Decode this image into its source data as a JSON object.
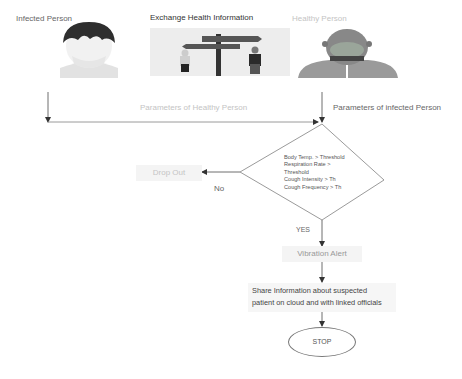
{
  "top_labels": {
    "infected": "Infected Person",
    "exchange": "Exchange Health Information",
    "healthy": "Healthy Person"
  },
  "images": {
    "infected": "infected-person-avatar",
    "exchange": "signpost-exchange-illustration",
    "healthy": "healthy-person-avatar"
  },
  "flow": {
    "param_healthy": "Parameters of Healthy Person",
    "param_infected": "Parameters of infected Person",
    "decision_lines": [
      "Body Temp. > Threshold",
      "Respiration Rate >",
      "Threshold",
      "Cough Intensity > Th",
      "Cough Frequency > Th"
    ],
    "no_label": "No",
    "yes_label": "YES",
    "drop_out": "Drop Out",
    "vibration_alert": "Vibration Alert",
    "share_line1": "Share Information about suspected",
    "share_line2": "patient on cloud and with linked officials",
    "stop": "STOP"
  },
  "colors": {
    "line": "#6f6f6f",
    "box_fill": "#f4f4f4",
    "mask_green": "#9aa59a",
    "hair_dark": "#2e2e2e"
  }
}
